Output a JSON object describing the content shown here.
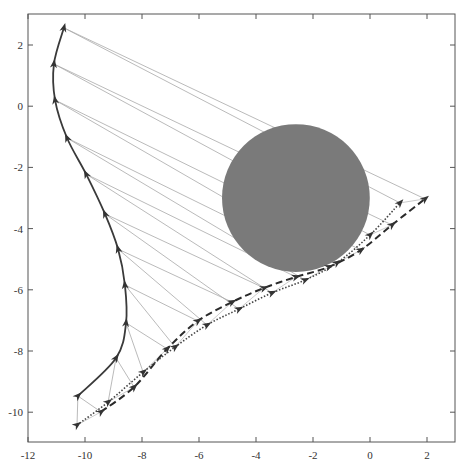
{
  "chart_data": {
    "type": "line",
    "title": "",
    "xlabel": "",
    "ylabel": "",
    "xlim": [
      -12,
      3
    ],
    "ylim": [
      -11,
      3
    ],
    "xticks": [
      -12,
      -10,
      -8,
      -6,
      -4,
      -2,
      0,
      2
    ],
    "yticks": [
      2,
      0,
      -2,
      -4,
      -6,
      -8,
      -10
    ],
    "grid": false,
    "legend": null,
    "obstacle": {
      "shape": "circle",
      "center": [
        -2.6,
        -3.0
      ],
      "radius": 2.5,
      "color": "#7a7a7a"
    },
    "series": [
      {
        "name": "solid-trajectory",
        "style": "solid",
        "color": "#3a3a3a",
        "markers": "arrowhead",
        "points": [
          [
            -10.25,
            -9.47
          ],
          [
            -8.91,
            -8.23
          ],
          [
            -8.56,
            -7.08
          ],
          [
            -8.6,
            -5.84
          ],
          [
            -8.84,
            -4.67
          ],
          [
            -9.3,
            -3.52
          ],
          [
            -9.96,
            -2.22
          ],
          [
            -10.63,
            -1.04
          ],
          [
            -11.05,
            0.2
          ],
          [
            -11.09,
            1.38
          ],
          [
            -10.74,
            2.56
          ]
        ]
      },
      {
        "name": "dashed-trajectory",
        "style": "dashed",
        "color": "#2a2a2a",
        "markers": "arrowhead",
        "points": [
          [
            -9.44,
            -9.99
          ],
          [
            -8.28,
            -9.18
          ],
          [
            -7.12,
            -7.93
          ],
          [
            -6.04,
            -7.02
          ],
          [
            -4.84,
            -6.4
          ],
          [
            -3.72,
            -5.94
          ],
          [
            -2.6,
            -5.58
          ],
          [
            -1.44,
            -5.25
          ],
          [
            -0.32,
            -4.7
          ],
          [
            0.77,
            -3.88
          ],
          [
            1.93,
            -3.03
          ]
        ]
      },
      {
        "name": "dotted-trajectory",
        "style": "dotted",
        "color": "#444444",
        "markers": "arrowhead",
        "points": [
          [
            -10.28,
            -10.42
          ],
          [
            -9.19,
            -9.67
          ],
          [
            -7.96,
            -8.69
          ],
          [
            -6.84,
            -7.87
          ],
          [
            -5.72,
            -7.15
          ],
          [
            -4.6,
            -6.63
          ],
          [
            -3.44,
            -6.1
          ],
          [
            -2.28,
            -5.68
          ],
          [
            -1.16,
            -5.12
          ],
          [
            0.0,
            -4.21
          ],
          [
            1.05,
            -3.16
          ]
        ]
      }
    ],
    "connectors": {
      "description": "thin grey lines linking each solid-trajectory point (reversed order) to the dashed and dotted points of the same index",
      "color": "#a8a8a8"
    }
  }
}
